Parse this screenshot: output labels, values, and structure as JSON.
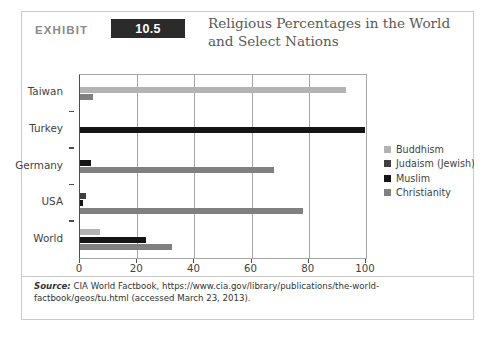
{
  "exhibit": {
    "label": "EXHIBIT",
    "number": "10.5",
    "title": "Religious Percentages in the World and Select Nations"
  },
  "source": {
    "label": "Source:",
    "text": " CIA World Factbook, https://www.cia.gov/library/publications/the-world-factbook/geos/tu.html (accessed March 23, 2013)."
  },
  "colors": {
    "buddhism": "#b3b3b3",
    "judaism": "#404040",
    "muslim": "#151515",
    "christianity": "#808080",
    "axis": "#4d4d4d",
    "grid": "#a6a6a6",
    "badge": "#2b2b2b",
    "card_border": "#c9c9c9"
  },
  "chart_data": {
    "type": "bar",
    "orientation": "horizontal",
    "title": "Religious Percentages in the World and Select Nations",
    "xlabel": "",
    "ylabel": "",
    "xlim": [
      0,
      100
    ],
    "xticks": [
      0,
      20,
      40,
      60,
      80,
      100
    ],
    "grid": true,
    "legend_position": "right",
    "categories": [
      "Taiwan",
      "Turkey",
      "Germany",
      "USA",
      "World"
    ],
    "series": [
      {
        "name": "Buddhism",
        "color": "#b3b3b3",
        "values": [
          93,
          0,
          0,
          0,
          7
        ]
      },
      {
        "name": "Judaism (Jewish)",
        "color": "#404040",
        "values": [
          0,
          0,
          0,
          2,
          0
        ]
      },
      {
        "name": "Muslim",
        "color": "#151515",
        "values": [
          0,
          99.8,
          3.7,
          1,
          23
        ]
      },
      {
        "name": "Christianity",
        "color": "#808080",
        "values": [
          4.5,
          0,
          68,
          78,
          32
        ]
      }
    ]
  }
}
